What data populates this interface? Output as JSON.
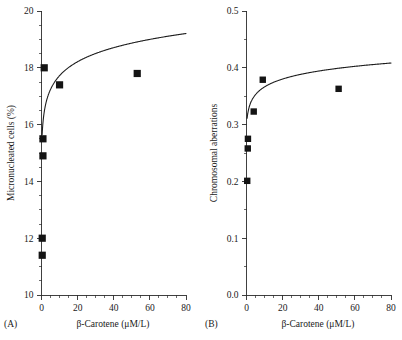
{
  "figure": {
    "background": "#ffffff",
    "marker_color": "#141414",
    "curve_color": "#1d1d1d",
    "axis_color": "#2b2b2b"
  },
  "panels": [
    {
      "tag": "(A)",
      "chart_data": {
        "type": "scatter",
        "title": "",
        "xlabel": "β-Carotene (μM/L)",
        "ylabel": "Micronucleated cells (%)",
        "xlim": [
          0,
          80
        ],
        "ylim": [
          10,
          20
        ],
        "grid": false,
        "legend": "none",
        "x_ticks": [
          0,
          20,
          40,
          60,
          80
        ],
        "x_tick_labels": [
          "0",
          "20",
          "40",
          "60",
          "80"
        ],
        "x_minor_step": 5,
        "y_ticks": [
          10,
          12,
          14,
          16,
          18,
          20
        ],
        "y_tick_labels": [
          "10",
          "12",
          "14",
          "16",
          "18",
          "20"
        ],
        "y_minor_step": 0.5,
        "points": [
          {
            "x": 0.4,
            "y": 11.4
          },
          {
            "x": 0.4,
            "y": 12.0
          },
          {
            "x": 0.8,
            "y": 14.9
          },
          {
            "x": 0.8,
            "y": 15.5
          },
          {
            "x": 1.5,
            "y": 18.0
          },
          {
            "x": 10.0,
            "y": 17.4
          },
          {
            "x": 53.0,
            "y": 17.8
          }
        ],
        "fit": {
          "form": "logarithmic",
          "expression": "y = a + b*ln(x + c)",
          "a": 16.05,
          "b": 0.72,
          "c": 0.22,
          "x_start": 0.35,
          "x_end": 80
        }
      }
    },
    {
      "tag": "(B)",
      "chart_data": {
        "type": "scatter",
        "title": "",
        "xlabel": "β-Carotene (μM/L)",
        "ylabel": "Chromosomal aberrations",
        "xlim": [
          0,
          80
        ],
        "ylim": [
          0.0,
          0.5
        ],
        "grid": false,
        "legend": "none",
        "x_ticks": [
          0,
          20,
          40,
          60,
          80
        ],
        "x_tick_labels": [
          "0",
          "20",
          "40",
          "60",
          "80"
        ],
        "x_minor_step": 5,
        "y_ticks": [
          0.0,
          0.1,
          0.2,
          0.3,
          0.4,
          0.5
        ],
        "y_tick_labels": [
          "0.0",
          "0.1",
          "0.2",
          "0.3",
          "0.4",
          "0.5"
        ],
        "y_minor_step": 0.05,
        "points": [
          {
            "x": 0.4,
            "y": 0.201
          },
          {
            "x": 0.7,
            "y": 0.258
          },
          {
            "x": 0.8,
            "y": 0.275
          },
          {
            "x": 4.0,
            "y": 0.323
          },
          {
            "x": 9.0,
            "y": 0.379
          },
          {
            "x": 51.0,
            "y": 0.363
          }
        ],
        "fit": {
          "form": "logarithmic",
          "expression": "y = a + b*ln(x + c)",
          "a": 0.3185,
          "b": 0.0205,
          "c": 0.35,
          "x_start": 0.35,
          "x_end": 80
        }
      }
    }
  ]
}
